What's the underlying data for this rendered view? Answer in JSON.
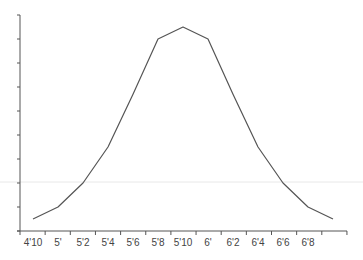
{
  "chart_data": {
    "type": "line",
    "title": "",
    "xlabel": "",
    "ylabel": "",
    "categories": [
      "4'10",
      "5'",
      "5'2",
      "5'4",
      "5'6",
      "5'8",
      "5'10",
      "6'",
      "6'2",
      "6'4",
      "6'6",
      "6'8",
      ""
    ],
    "x_tick_labels": [
      "4'10",
      "5'",
      "5'2",
      "5'4",
      "5'6",
      "5'8",
      "5'10",
      "6'",
      "6'2",
      "6'4",
      "6'6",
      "6'8"
    ],
    "series": [
      {
        "name": "height distribution",
        "values": [
          0.5,
          1.0,
          2.0,
          3.5,
          5.7,
          8.0,
          8.5,
          8.0,
          5.7,
          3.5,
          2.0,
          1.0,
          0.5
        ]
      }
    ],
    "ylim": [
      0,
      9
    ],
    "y_ticks": 10,
    "y_tick_labels_shown": false,
    "grid": false,
    "reference_line_y": 2.0,
    "legend": "none",
    "colors": {
      "line": "#555555",
      "axis": "#555555",
      "reference": "#e6e6e6"
    }
  }
}
